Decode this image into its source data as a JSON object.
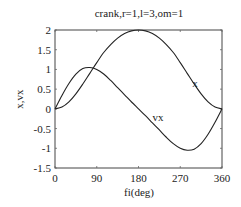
{
  "chart_data": {
    "type": "line",
    "title": "crank,r=1,l=3,om=1",
    "xlabel": "fi(deg)",
    "ylabel": "x,vx",
    "xlim": [
      0,
      360
    ],
    "ylim": [
      -1.5,
      2
    ],
    "xticks": [
      0,
      90,
      180,
      270,
      360
    ],
    "xtick_labels": [
      "0",
      "90",
      "180",
      "270",
      "360"
    ],
    "yticks": [
      2,
      1.5,
      1,
      0.5,
      0,
      -0.5,
      -1,
      -1.5
    ],
    "ytick_labels": [
      "2",
      "1.5",
      "1",
      "0.5",
      "0",
      "-0.5",
      "-1",
      "-1.5"
    ],
    "grid": false,
    "x": [
      0,
      15,
      30,
      45,
      60,
      75,
      90,
      105,
      120,
      135,
      150,
      165,
      180,
      195,
      210,
      225,
      240,
      255,
      270,
      285,
      300,
      315,
      330,
      345,
      360
    ],
    "series": [
      {
        "name": "x",
        "label": "x",
        "values": [
          0,
          0.045,
          0.176,
          0.38,
          0.63,
          0.901,
          1.172,
          1.429,
          1.63,
          1.794,
          1.911,
          1.978,
          2.0,
          1.978,
          1.911,
          1.794,
          1.63,
          1.429,
          1.172,
          0.901,
          0.63,
          0.38,
          0.176,
          0.045,
          0
        ]
      },
      {
        "name": "vx",
        "label": "vx",
        "values": [
          0,
          0.341,
          0.644,
          0.881,
          1.022,
          1.049,
          1.0,
          0.883,
          0.72,
          0.536,
          0.356,
          0.174,
          0,
          -0.174,
          -0.356,
          -0.536,
          -0.72,
          -0.883,
          -1.0,
          -1.049,
          -1.022,
          -0.881,
          -0.644,
          -0.341,
          0
        ]
      }
    ],
    "annotations": [
      {
        "text": "x",
        "x": 296,
        "y": 0.55
      },
      {
        "text": "vx",
        "x": 210,
        "y": -0.3
      }
    ]
  }
}
